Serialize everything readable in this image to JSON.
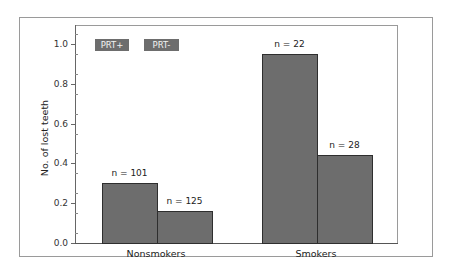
{
  "chart_data": {
    "type": "bar",
    "title": "",
    "xlabel": "",
    "ylabel": "No. of lost teeth",
    "ylim": [
      0,
      1.1
    ],
    "yticks": [
      "0.0",
      "0.2",
      "0.4",
      "0.6",
      "0.8",
      "1.0"
    ],
    "categories": [
      "Nonsmokers",
      "Smokers"
    ],
    "series": [
      {
        "name": "PRT+",
        "values": [
          0.3,
          0.95
        ],
        "n_labels": [
          "n = 101",
          "n = 22"
        ]
      },
      {
        "name": "PRT-",
        "values": [
          0.16,
          0.44
        ],
        "n_labels": [
          "n = 125",
          "n = 28"
        ]
      }
    ],
    "legend": [
      "PRT+",
      "PRT-"
    ],
    "legend_position": "top-left inside",
    "grid": false,
    "bar_color": "#6d6d6d"
  }
}
